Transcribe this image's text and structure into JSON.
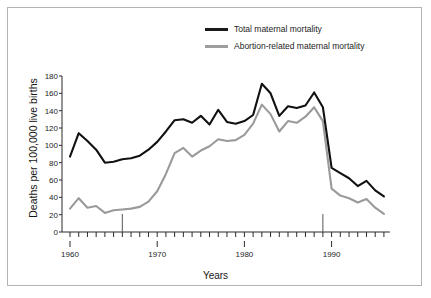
{
  "figure": {
    "ylabel": "Deaths per 100,000 live births",
    "xlabel": "Years",
    "caption": ""
  },
  "legend": {
    "position": "top-right",
    "items": [
      {
        "label": "Total maternal mortality",
        "color": "#111111",
        "key": "total"
      },
      {
        "label": "Abortion-related maternal mortality",
        "color": "#9a9a9a",
        "key": "abortion"
      }
    ]
  },
  "axes": {
    "y_ticks": [
      "0",
      "20",
      "40",
      "60",
      "80",
      "100",
      "120",
      "140",
      "160",
      "180"
    ],
    "x_ticks": [
      "1960",
      "1970",
      "1980",
      "1990"
    ]
  },
  "chart_data": {
    "type": "line",
    "title": "",
    "subtitle": "",
    "xlabel": "Years",
    "ylabel": "Deaths per 100,000 live births",
    "xlim": [
      1960,
      1996
    ],
    "ylim": [
      0,
      188
    ],
    "ytick_values": [
      0,
      20,
      40,
      60,
      80,
      100,
      120,
      140,
      160,
      180
    ],
    "xtick_values": [
      1960,
      1970,
      1980,
      1990
    ],
    "minor_x_ticks": "every year",
    "grid": false,
    "legend_position": "top-right",
    "annotations": [
      {
        "type": "vertical-marker",
        "x": 1966,
        "label": ""
      },
      {
        "type": "vertical-marker",
        "x": 1989,
        "label": ""
      }
    ],
    "x": [
      1960,
      1961,
      1962,
      1963,
      1964,
      1965,
      1966,
      1967,
      1968,
      1969,
      1970,
      1971,
      1972,
      1973,
      1974,
      1975,
      1976,
      1977,
      1978,
      1979,
      1980,
      1981,
      1982,
      1983,
      1984,
      1985,
      1986,
      1987,
      1988,
      1989,
      1990,
      1991,
      1992,
      1993,
      1994,
      1995,
      1996
    ],
    "series": [
      {
        "name": "Total maternal mortality",
        "color": "#111111",
        "values": [
          87,
          114,
          105,
          95,
          80,
          81,
          84,
          85,
          88,
          95,
          104,
          116,
          129,
          130,
          126,
          134,
          124,
          141,
          127,
          125,
          128,
          135,
          171,
          160,
          134,
          145,
          143,
          146,
          161,
          144,
          74,
          68,
          62,
          53,
          59,
          48,
          41
        ]
      },
      {
        "name": "Abortion-related maternal mortality",
        "color": "#9a9a9a",
        "values": [
          27,
          39,
          28,
          30,
          22,
          25,
          26,
          27,
          29,
          35,
          47,
          67,
          91,
          97,
          87,
          94,
          99,
          107,
          105,
          106,
          112,
          125,
          147,
          136,
          116,
          128,
          126,
          133,
          144,
          128,
          50,
          42,
          39,
          34,
          38,
          28,
          21
        ]
      }
    ]
  }
}
